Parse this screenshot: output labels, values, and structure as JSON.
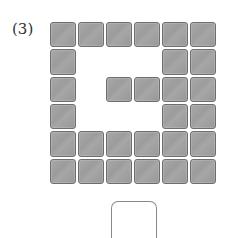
{
  "problem": {
    "label": "(3)",
    "grid": {
      "columns": 6,
      "rows": 6,
      "filled": [
        [
          1,
          1,
          1,
          1,
          1,
          1
        ],
        [
          1,
          0,
          0,
          0,
          1,
          1
        ],
        [
          1,
          0,
          1,
          1,
          1,
          1
        ],
        [
          1,
          0,
          0,
          0,
          1,
          1
        ],
        [
          1,
          1,
          1,
          1,
          1,
          1
        ],
        [
          1,
          1,
          1,
          1,
          1,
          1
        ]
      ],
      "tile_color": "#a0a0a0",
      "tile_border": "#6e6e6e"
    },
    "answer_box": {
      "value": ""
    }
  }
}
